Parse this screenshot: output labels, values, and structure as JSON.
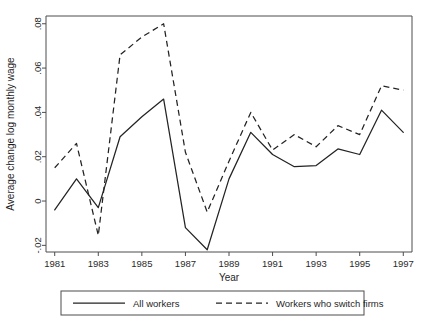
{
  "chart_data": {
    "type": "line",
    "title": "",
    "xlabel": "Year",
    "ylabel": "Average change log monthly wage",
    "x": [
      1981,
      1982,
      1983,
      1984,
      1985,
      1986,
      1987,
      1988,
      1989,
      1990,
      1991,
      1992,
      1993,
      1994,
      1995,
      1996,
      1997
    ],
    "xlim": [
      1980.6,
      1997.4
    ],
    "ylim": [
      -0.023,
      0.0835
    ],
    "xticks": [
      1981,
      1983,
      1985,
      1987,
      1989,
      1991,
      1993,
      1995,
      1997
    ],
    "xticklabels": [
      "1981",
      "1983",
      "1985",
      "1987",
      "1989",
      "1991",
      "1993",
      "1995",
      "1997"
    ],
    "yticks": [
      -0.02,
      0,
      0.02,
      0.04,
      0.06,
      0.08
    ],
    "yticklabels": [
      "-.02",
      "0",
      ".02",
      ".04",
      ".06",
      ".08"
    ],
    "grid": false,
    "legend_position": "below-plot",
    "series": [
      {
        "name": "All workers",
        "style": "solid",
        "color": "#232323",
        "values": [
          -0.004,
          0.01,
          -0.003,
          0.029,
          0.038,
          0.046,
          -0.012,
          -0.022,
          0.01,
          0.031,
          0.021,
          0.0155,
          0.016,
          0.0235,
          0.021,
          0.041,
          0.031
        ]
      },
      {
        "name": "Workers who switch firms",
        "style": "dashed",
        "color": "#232323",
        "values": [
          0.015,
          0.026,
          -0.0155,
          0.066,
          0.074,
          0.08,
          0.022,
          -0.005,
          0.018,
          0.04,
          0.023,
          0.03,
          0.0245,
          0.034,
          0.03,
          0.052,
          0.05
        ]
      }
    ]
  },
  "legend": {
    "entries": [
      {
        "label": "All workers",
        "style": "solid"
      },
      {
        "label": "Workers who switch firms",
        "style": "dashed"
      }
    ]
  }
}
